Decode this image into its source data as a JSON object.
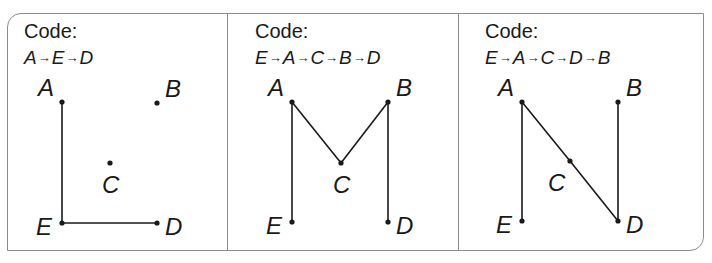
{
  "header": {
    "cropped_text": "y g                                                                  ( )"
  },
  "panels": [
    {
      "code_label": "Code:",
      "sequence": [
        "A",
        "E",
        "D"
      ],
      "sequence_text": "A→E→D",
      "points": {
        "A": {
          "x": 62,
          "y": 102,
          "label_dx": -24,
          "label_dy": -6
        },
        "B": {
          "x": 157,
          "y": 103,
          "label_dx": 8,
          "label_dy": -6
        },
        "C": {
          "x": 110,
          "y": 163,
          "label_dx": -8,
          "label_dy": 30
        },
        "E": {
          "x": 62,
          "y": 223,
          "label_dx": -26,
          "label_dy": 12
        },
        "D": {
          "x": 157,
          "y": 223,
          "label_dx": 8,
          "label_dy": 12
        }
      }
    },
    {
      "code_label": "Code:",
      "sequence": [
        "E",
        "A",
        "C",
        "B",
        "D"
      ],
      "sequence_text": "E→A→C→B→D",
      "points": {
        "A": {
          "x": 292,
          "y": 102,
          "label_dx": -24,
          "label_dy": -6
        },
        "B": {
          "x": 388,
          "y": 102,
          "label_dx": 8,
          "label_dy": -6
        },
        "C": {
          "x": 341,
          "y": 163,
          "label_dx": -8,
          "label_dy": 30
        },
        "E": {
          "x": 292,
          "y": 222,
          "label_dx": -26,
          "label_dy": 12
        },
        "D": {
          "x": 388,
          "y": 222,
          "label_dx": 8,
          "label_dy": 12
        }
      }
    },
    {
      "code_label": "Code:",
      "sequence": [
        "E",
        "A",
        "C",
        "D",
        "B"
      ],
      "sequence_text": "E→A→C→D→B",
      "points": {
        "A": {
          "x": 522,
          "y": 102,
          "label_dx": -24,
          "label_dy": -6
        },
        "B": {
          "x": 618,
          "y": 102,
          "label_dx": 8,
          "label_dy": -6
        },
        "C": {
          "x": 570,
          "y": 161,
          "label_dx": -22,
          "label_dy": 30
        },
        "E": {
          "x": 522,
          "y": 221,
          "label_dx": -26,
          "label_dy": 12
        },
        "D": {
          "x": 618,
          "y": 221,
          "label_dx": 8,
          "label_dy": 12
        }
      }
    }
  ],
  "colors": {
    "line": "#1a1a1a",
    "border": "#8c8c8c",
    "text": "#1a1a1a"
  }
}
